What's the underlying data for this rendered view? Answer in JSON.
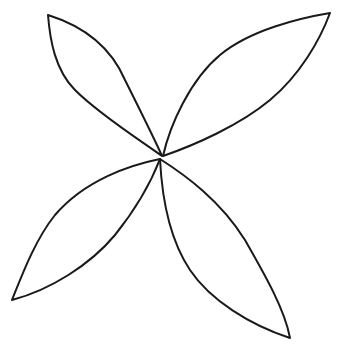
{
  "figure": {
    "background": "#ffffff",
    "stroke_color": "#1a1a1a",
    "center": [
      161,
      157
    ],
    "petals": [
      {
        "name": "top-left",
        "tip": [
          48,
          15
        ],
        "base": [
          162,
          156
        ]
      },
      {
        "name": "top-right",
        "tip": [
          330,
          13
        ],
        "base": [
          163,
          156
        ]
      },
      {
        "name": "bottom-left",
        "tip": [
          12,
          300
        ],
        "base": [
          160,
          159
        ]
      },
      {
        "name": "bottom-right",
        "tip": [
          290,
          338
        ],
        "base": [
          160,
          159
        ]
      }
    ]
  }
}
